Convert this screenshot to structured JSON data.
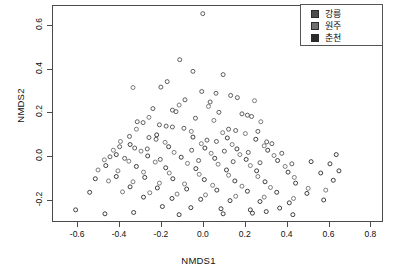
{
  "chart_data": {
    "type": "scatter",
    "title": "",
    "xlabel": "NMDS1",
    "ylabel": "NMDS2",
    "xlim": [
      -0.72,
      0.86
    ],
    "ylim": [
      -0.3,
      0.69
    ],
    "xticks": [
      -0.6,
      -0.4,
      -0.2,
      0.0,
      0.2,
      0.4,
      0.6,
      0.8
    ],
    "xticklabels": [
      "-0.6",
      "-0.4",
      "-0.2",
      "0.0",
      "0.2",
      "0.4",
      "0.6",
      "0.8"
    ],
    "yticks": [
      -0.2,
      0.0,
      0.2,
      0.4,
      0.6
    ],
    "yticklabels": [
      "-0.2",
      "0.0",
      "0.2",
      "0.4",
      "0.6"
    ],
    "grid": false,
    "marker": "open-circle",
    "marker_size": 4,
    "marker_color": "#555555",
    "legend_position": "top-right",
    "series": [
      {
        "name": "강릉",
        "color": "#4d4d4d",
        "points": [
          [
            -0.005,
            0.655
          ],
          [
            -0.115,
            0.445
          ],
          [
            -0.052,
            0.392
          ],
          [
            0.092,
            0.377
          ],
          [
            -0.175,
            0.345
          ],
          [
            -0.205,
            0.32
          ],
          [
            -0.01,
            0.3
          ],
          [
            0.058,
            0.292
          ],
          [
            0.128,
            0.282
          ],
          [
            0.16,
            0.272
          ],
          [
            -0.09,
            0.262
          ],
          [
            0.03,
            0.252
          ],
          [
            -0.243,
            0.222
          ],
          [
            -0.15,
            0.215
          ],
          [
            -0.133,
            0.208
          ],
          [
            0.072,
            0.205
          ],
          [
            0.182,
            0.198
          ],
          [
            0.208,
            0.192
          ],
          [
            0.228,
            0.186
          ],
          [
            -0.04,
            0.178
          ],
          [
            -0.318,
            0.162
          ],
          [
            -0.29,
            0.158
          ],
          [
            -0.212,
            0.148
          ],
          [
            -0.18,
            0.142
          ],
          [
            -0.15,
            0.138
          ],
          [
            -0.095,
            0.132
          ],
          [
            0.118,
            0.128
          ],
          [
            0.152,
            0.122
          ],
          [
            0.258,
            0.118
          ],
          [
            -0.355,
            0.095
          ],
          [
            -0.262,
            0.09
          ],
          [
            -0.228,
            0.082
          ],
          [
            0.015,
            0.078
          ],
          [
            0.06,
            0.072
          ],
          [
            0.3,
            0.07
          ],
          [
            0.325,
            0.062
          ],
          [
            -0.402,
            0.048
          ],
          [
            -0.33,
            0.042
          ],
          [
            -0.27,
            0.038
          ],
          [
            -0.058,
            0.032
          ],
          [
            0.098,
            0.028
          ],
          [
            0.212,
            0.022
          ],
          [
            0.372,
            0.018
          ],
          [
            -0.448,
            0.002
          ],
          [
            -0.378,
            -0.005
          ],
          [
            -0.208,
            -0.01
          ],
          [
            -0.025,
            -0.015
          ],
          [
            0.14,
            -0.02
          ],
          [
            0.268,
            -0.025
          ],
          [
            0.42,
            -0.03
          ]
        ]
      },
      {
        "name": "원주",
        "color": "#6e6e6e",
        "points": [
          [
            -0.338,
            0.318
          ],
          [
            0.242,
            0.258
          ],
          [
            -0.118,
            0.238
          ],
          [
            0.022,
            0.232
          ],
          [
            -0.262,
            0.182
          ],
          [
            0.048,
            0.168
          ],
          [
            0.272,
            0.162
          ],
          [
            -0.322,
            0.128
          ],
          [
            -0.06,
            0.118
          ],
          [
            0.09,
            0.112
          ],
          [
            0.198,
            0.108
          ],
          [
            -0.398,
            0.072
          ],
          [
            -0.185,
            0.068
          ],
          [
            -0.012,
            0.062
          ],
          [
            0.135,
            0.058
          ],
          [
            0.288,
            0.052
          ],
          [
            -0.432,
            0.032
          ],
          [
            -0.3,
            0.028
          ],
          [
            -0.142,
            0.022
          ],
          [
            0.035,
            0.018
          ],
          [
            0.172,
            0.012
          ],
          [
            0.335,
            0.008
          ],
          [
            -0.475,
            -0.012
          ],
          [
            -0.358,
            -0.018
          ],
          [
            -0.232,
            -0.022
          ],
          [
            -0.078,
            -0.028
          ],
          [
            0.068,
            -0.032
          ],
          [
            0.222,
            -0.038
          ],
          [
            0.388,
            -0.042
          ],
          [
            -0.505,
            -0.058
          ],
          [
            -0.41,
            -0.062
          ],
          [
            -0.288,
            -0.068
          ],
          [
            -0.165,
            -0.072
          ],
          [
            -0.022,
            -0.078
          ],
          [
            0.118,
            -0.082
          ],
          [
            0.258,
            -0.088
          ],
          [
            0.432,
            -0.092
          ],
          [
            -0.455,
            -0.108
          ],
          [
            -0.338,
            -0.112
          ],
          [
            -0.212,
            -0.118
          ],
          [
            -0.092,
            -0.122
          ],
          [
            0.042,
            -0.128
          ],
          [
            0.182,
            -0.132
          ],
          [
            0.318,
            -0.138
          ],
          [
            0.498,
            -0.142
          ],
          [
            -0.388,
            -0.158
          ],
          [
            -0.258,
            -0.162
          ],
          [
            -0.128,
            -0.168
          ],
          [
            0.008,
            -0.172
          ],
          [
            0.152,
            -0.178
          ],
          [
            0.288,
            -0.182
          ],
          [
            0.428,
            -0.188
          ],
          [
            0.582,
            -0.15
          ]
        ]
      },
      {
        "name": "춘천",
        "color": "#2b2b2b",
        "points": [
          [
            -0.225,
            0.102
          ],
          [
            -0.052,
            0.092
          ],
          [
            0.112,
            0.088
          ],
          [
            0.248,
            0.082
          ],
          [
            -0.352,
            0.058
          ],
          [
            -0.168,
            0.048
          ],
          [
            0.005,
            0.042
          ],
          [
            0.158,
            0.038
          ],
          [
            0.305,
            0.032
          ],
          [
            -0.418,
            0.012
          ],
          [
            -0.268,
            0.006
          ],
          [
            -0.108,
            0.0
          ],
          [
            0.052,
            -0.005
          ],
          [
            0.202,
            -0.01
          ],
          [
            0.352,
            -0.015
          ],
          [
            0.512,
            -0.02
          ],
          [
            -0.468,
            -0.038
          ],
          [
            -0.322,
            -0.042
          ],
          [
            -0.182,
            -0.048
          ],
          [
            -0.038,
            -0.052
          ],
          [
            0.108,
            -0.058
          ],
          [
            0.252,
            -0.062
          ],
          [
            0.402,
            -0.068
          ],
          [
            0.558,
            -0.072
          ],
          [
            -0.418,
            -0.088
          ],
          [
            -0.282,
            -0.092
          ],
          [
            -0.148,
            -0.098
          ],
          [
            0.002,
            -0.102
          ],
          [
            0.148,
            -0.108
          ],
          [
            0.292,
            -0.112
          ],
          [
            0.438,
            -0.118
          ],
          [
            0.618,
            -0.105
          ],
          [
            -0.352,
            -0.135
          ],
          [
            -0.222,
            -0.14
          ],
          [
            -0.082,
            -0.145
          ],
          [
            0.062,
            -0.15
          ],
          [
            0.208,
            -0.155
          ],
          [
            0.348,
            -0.16
          ],
          [
            0.492,
            -0.165
          ],
          [
            -0.288,
            -0.182
          ],
          [
            -0.152,
            -0.188
          ],
          [
            -0.015,
            -0.192
          ],
          [
            0.125,
            -0.198
          ],
          [
            0.268,
            -0.202
          ],
          [
            0.408,
            -0.208
          ],
          [
            -0.198,
            -0.225
          ],
          [
            -0.062,
            -0.23
          ],
          [
            0.082,
            -0.235
          ],
          [
            0.222,
            -0.24
          ],
          [
            0.362,
            -0.232
          ],
          [
            -0.472,
            -0.258
          ],
          [
            -0.335,
            -0.252
          ],
          [
            -0.118,
            -0.262
          ],
          [
            0.092,
            -0.258
          ],
          [
            0.232,
            -0.255
          ],
          [
            0.298,
            -0.248
          ],
          [
            0.425,
            -0.262
          ],
          [
            -0.612,
            -0.24
          ],
          [
            0.645,
            -0.062
          ],
          [
            0.632,
            0.012
          ],
          [
            0.602,
            -0.03
          ],
          [
            -0.545,
            -0.16
          ],
          [
            -0.518,
            -0.098
          ],
          [
            0.572,
            -0.195
          ]
        ]
      }
    ]
  },
  "legend": {
    "items": [
      {
        "label": "강릉",
        "color": "#4d4d4d"
      },
      {
        "label": "원주",
        "color": "#6e6e6e"
      },
      {
        "label": "춘천",
        "color": "#2b2b2b"
      }
    ]
  }
}
